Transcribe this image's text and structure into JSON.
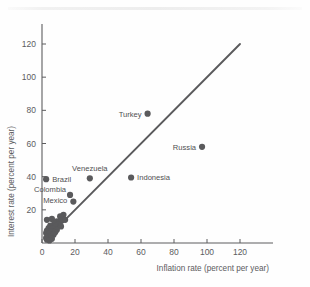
{
  "chart_data": {
    "type": "scatter",
    "title": "",
    "xlabel": "Inflation rate (percent per year)",
    "ylabel": "Interest rate (percent per year)",
    "xlim": [
      0,
      140
    ],
    "ylim": [
      0,
      132
    ],
    "xticks": [
      "0",
      "20",
      "40",
      "60",
      "80",
      "100",
      "120"
    ],
    "xtick_values": [
      0,
      20,
      40,
      60,
      80,
      100,
      120
    ],
    "yticks": [
      "20",
      "40",
      "60",
      "80",
      "100",
      "120"
    ],
    "ytick_values": [
      20,
      40,
      60,
      80,
      100,
      120
    ],
    "grid": false,
    "legend": "none",
    "reference_line": {
      "name": "45-degree line",
      "from": [
        6,
        6
      ],
      "to": [
        120,
        120
      ],
      "color": "#5a5a5c"
    },
    "annotations": [
      {
        "label": "Turkey",
        "x": 64,
        "y": 78,
        "label_side": "left"
      },
      {
        "label": "Russia",
        "x": 97,
        "y": 58,
        "label_side": "left"
      },
      {
        "label": "Venezuela",
        "x": 29,
        "y": 39,
        "label_side": "above"
      },
      {
        "label": "Indonesia",
        "x": 54,
        "y": 39.5,
        "label_side": "right"
      },
      {
        "label": "Brazil",
        "x": 2.5,
        "y": 38.5,
        "label_side": "right"
      },
      {
        "label": "Colombia",
        "x": 17,
        "y": 29,
        "label_side": "left"
      },
      {
        "label": "Mexico",
        "x": 19,
        "y": 25,
        "label_side": "left"
      }
    ],
    "points": [
      {
        "x": 64,
        "y": 78
      },
      {
        "x": 97,
        "y": 58
      },
      {
        "x": 29,
        "y": 39
      },
      {
        "x": 54,
        "y": 39.5
      },
      {
        "x": 2.5,
        "y": 38.5
      },
      {
        "x": 17,
        "y": 29
      },
      {
        "x": 19,
        "y": 25
      },
      {
        "x": 13,
        "y": 17
      },
      {
        "x": 11,
        "y": 16
      },
      {
        "x": 3,
        "y": 14
      },
      {
        "x": 6,
        "y": 14.5
      },
      {
        "x": 9,
        "y": 13
      },
      {
        "x": 12,
        "y": 13.5
      },
      {
        "x": 14,
        "y": 14
      },
      {
        "x": 7.5,
        "y": 12
      },
      {
        "x": 10,
        "y": 11
      },
      {
        "x": 5,
        "y": 10.5
      },
      {
        "x": 8,
        "y": 10
      },
      {
        "x": 11.5,
        "y": 10
      },
      {
        "x": 4,
        "y": 9
      },
      {
        "x": 6.5,
        "y": 8.5
      },
      {
        "x": 9,
        "y": 8
      },
      {
        "x": 3,
        "y": 7.5
      },
      {
        "x": 5.5,
        "y": 7
      },
      {
        "x": 8,
        "y": 6.5
      },
      {
        "x": 2.5,
        "y": 6
      },
      {
        "x": 4.5,
        "y": 5.5
      },
      {
        "x": 7,
        "y": 5
      },
      {
        "x": 3.5,
        "y": 4
      },
      {
        "x": 5,
        "y": 3.5
      },
      {
        "x": 2.5,
        "y": 3
      },
      {
        "x": 6,
        "y": 2.5
      },
      {
        "x": 3,
        "y": 2
      },
      {
        "x": 4.5,
        "y": 1.5
      }
    ]
  }
}
